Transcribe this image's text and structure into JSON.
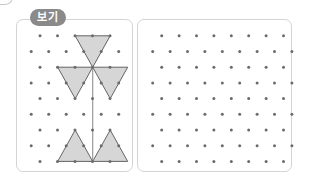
{
  "badge": {
    "label": "보기"
  },
  "colors": {
    "dot": "#6b6b6b",
    "triangle_fill": "#d6d6d6",
    "triangle_stroke": "#555555",
    "stem": "#9a9a9a",
    "panel_border": "#d4d4d4",
    "badge_bg": "#8a8a8a"
  },
  "example_panel": {
    "grid": {
      "rows": 9,
      "even_row_dots": 5,
      "odd_row_dots": 6,
      "row_spacing": 15.7,
      "col_spacing": 17.5
    },
    "figure": {
      "description": "Flower-like figure: three shaded triangles on top meeting at a center point, a vertical stem, and two shaded upward triangles at the base",
      "shapes": [
        {
          "name": "top-triangle",
          "points": [
            [
              0,
              1
            ],
            [
              0,
              3
            ],
            [
              2,
              2
            ]
          ]
        },
        {
          "name": "upper-left-triangle",
          "points": [
            [
              2,
              0
            ],
            [
              2,
              2
            ],
            [
              4,
              1
            ]
          ]
        },
        {
          "name": "upper-right-triangle",
          "points": [
            [
              2,
              2
            ],
            [
              2,
              4
            ],
            [
              4,
              3
            ]
          ]
        },
        {
          "name": "lower-left-triangle",
          "points": [
            [
              6,
              1
            ],
            [
              8,
              0
            ],
            [
              8,
              2
            ]
          ]
        },
        {
          "name": "lower-right-triangle",
          "points": [
            [
              6,
              3
            ],
            [
              8,
              2
            ],
            [
              8,
              4
            ]
          ]
        },
        {
          "name": "stem",
          "points": [
            [
              2,
              2
            ],
            [
              8,
              2
            ]
          ]
        }
      ]
    }
  },
  "answer_panel": {
    "grid": {
      "rows": 9,
      "even_row_dots": 8,
      "odd_row_dots": 9,
      "row_spacing": 15.7,
      "col_spacing": 17.4
    }
  }
}
